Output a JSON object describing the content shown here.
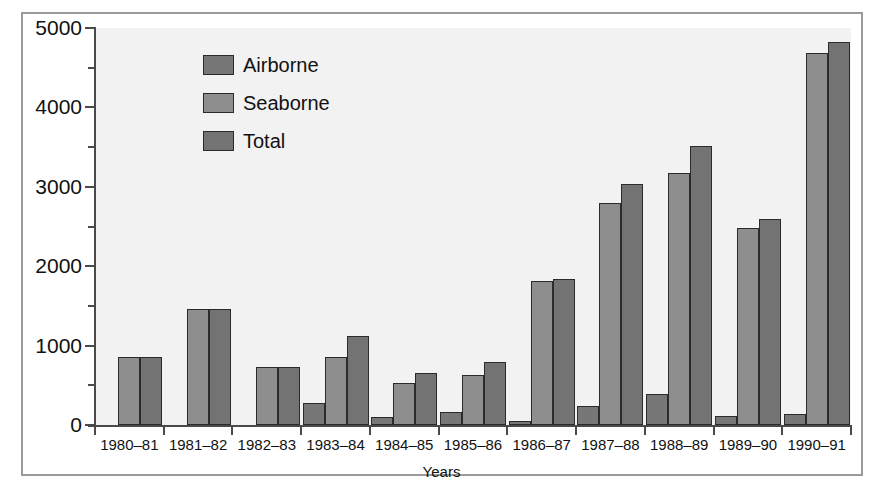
{
  "chart_data": {
    "type": "bar",
    "title": "",
    "subtitle": "",
    "xlabel": "Years",
    "ylabel": "",
    "categories": [
      "1980–81",
      "1981–82",
      "1982–83",
      "1983–84",
      "1984–85",
      "1985–86",
      "1986–87",
      "1987–88",
      "1988–89",
      "1989–90",
      "1990–91"
    ],
    "series": [
      {
        "name": "Airborne",
        "color": "#777777",
        "values": [
          0,
          0,
          0,
          280,
          100,
          160,
          45,
          245,
          390,
          110,
          140
        ]
      },
      {
        "name": "Seaborne",
        "color": "#8e8e8e",
        "values": [
          860,
          1460,
          730,
          860,
          530,
          630,
          1810,
          2790,
          3170,
          2480,
          4680
        ]
      },
      {
        "name": "Total",
        "color": "#737373",
        "values": [
          860,
          1460,
          730,
          1120,
          660,
          790,
          1840,
          3030,
          3510,
          2590,
          4830
        ]
      }
    ],
    "ylim": [
      0,
      5000
    ],
    "y_major_ticks": [
      0,
      1000,
      2000,
      3000,
      4000,
      5000
    ],
    "y_tick_labels": [
      "0",
      "1000",
      "2000",
      "3000",
      "4000",
      "5000"
    ],
    "y_minor_ticks": [
      500,
      1500,
      2500,
      3500,
      4500
    ],
    "grid": false,
    "legend_position": "upper-left-inside",
    "plot_background": "#f2f2f2",
    "frame_color": "#9a9a9a",
    "axis_color": "#4a4a4a",
    "bar_edge_color": "#2b2b2b"
  },
  "legend": {
    "items": [
      {
        "label": "Airborne"
      },
      {
        "label": "Seaborne"
      },
      {
        "label": "Total"
      }
    ]
  },
  "axis": {
    "x_title": "Years"
  }
}
